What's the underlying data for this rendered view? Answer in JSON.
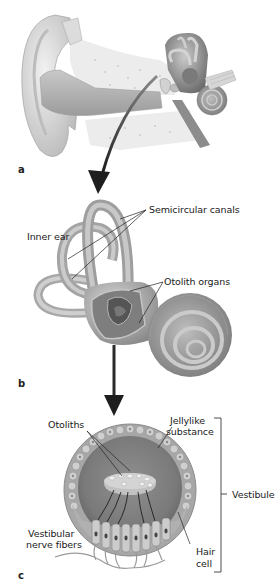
{
  "figure": {
    "panels": [
      {
        "id": "a",
        "letter": "a",
        "subject": "outer-middle-inner ear cross-section"
      },
      {
        "id": "b",
        "letter": "b",
        "subject": "inner ear"
      },
      {
        "id": "c",
        "letter": "c",
        "subject": "otolith organ / vestibule detail"
      }
    ],
    "labels": {
      "semicircular_canals": "Semicircular canals",
      "inner_ear": "Inner ear",
      "otolith_organs": "Otolith organs",
      "otoliths": "Otoliths",
      "jellylike_line1": "Jellylike",
      "jellylike_line2": "substance",
      "vestibule": "Vestibule",
      "vestibular_line1": "Vestibular",
      "vestibular_line2": "nerve fibers",
      "hair_line1": "Hair",
      "hair_line2": "cell"
    },
    "colors": {
      "background": "#ffffff",
      "tissue_light": "#d9d9d9",
      "tissue_mid": "#9a9a9a",
      "tissue_dark": "#5a5a5a",
      "arrow": "#2a2a2a",
      "leader_line": "#222222"
    }
  }
}
